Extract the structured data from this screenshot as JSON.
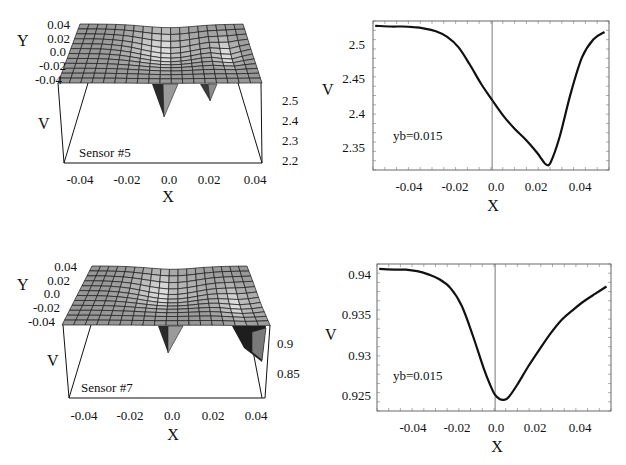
{
  "figure": {
    "panels": [
      {
        "id": "sensor5-surface",
        "kind": "surface3d",
        "label": "Sensor #5"
      },
      {
        "id": "sensor5-profile",
        "kind": "line",
        "annotation": "yb=0.015"
      },
      {
        "id": "sensor7-surface",
        "kind": "surface3d",
        "label": "Sensor #7"
      },
      {
        "id": "sensor7-profile",
        "kind": "line",
        "annotation": "yb=0.015"
      }
    ]
  },
  "chart_data": [
    {
      "type": "surface3d",
      "title": "",
      "annotation": "Sensor #5",
      "xlabel": "X",
      "ylabel": "Y",
      "zlabel": "V",
      "x_ticks": [
        "-0.04",
        "-0.02",
        "0.0",
        "0.02",
        "0.04"
      ],
      "y_ticks": [
        "0.04",
        "0.02",
        "0.0",
        "-0.02",
        "-0.04"
      ],
      "z_ticks": [
        "2.5",
        "2.4",
        "2.3",
        "2.2"
      ],
      "xlim": [
        -0.05,
        0.05
      ],
      "ylim": [
        -0.05,
        0.05
      ],
      "zlim": [
        2.15,
        2.55
      ],
      "features": [
        {
          "kind": "dip",
          "x": 0.0,
          "y": 0.0,
          "depth_to": 2.2
        },
        {
          "kind": "dip",
          "x": 0.02,
          "y": -0.02,
          "depth_to": 2.3
        }
      ]
    },
    {
      "type": "line",
      "title": "",
      "annotation": "yb=0.015",
      "xlabel": "X",
      "ylabel": "V",
      "x_ticks": [
        "-0.04",
        "-0.02",
        "0.0",
        "0.02",
        "0.04"
      ],
      "y_ticks": [
        "2.5",
        "2.45",
        "2.4",
        "2.35"
      ],
      "xlim": [
        -0.053,
        0.052
      ],
      "ylim": [
        2.318,
        2.535
      ],
      "grid": false,
      "vline_at": 0.0,
      "x": [
        -0.052,
        -0.045,
        -0.04,
        -0.035,
        -0.03,
        -0.025,
        -0.02,
        -0.015,
        -0.01,
        -0.005,
        0.0,
        0.005,
        0.01,
        0.015,
        0.02,
        0.022,
        0.024,
        0.026,
        0.03,
        0.035,
        0.04,
        0.045,
        0.05
      ],
      "values": [
        2.528,
        2.527,
        2.527,
        2.526,
        2.524,
        2.52,
        2.512,
        2.497,
        2.472,
        2.444,
        2.42,
        2.397,
        2.378,
        2.362,
        2.343,
        2.334,
        2.326,
        2.329,
        2.366,
        2.43,
        2.482,
        2.508,
        2.519
      ]
    },
    {
      "type": "surface3d",
      "title": "",
      "annotation": "Sensor #7",
      "xlabel": "X",
      "ylabel": "Y",
      "zlabel": "V",
      "x_ticks": [
        "-0.04",
        "-0.02",
        "0.0",
        "0.02",
        "0.04"
      ],
      "y_ticks": [
        "0.04",
        "0.02",
        "0.0",
        "-0.02",
        "-0.04"
      ],
      "z_ticks": [
        "0.9",
        "0.85"
      ],
      "xlim": [
        -0.05,
        0.05
      ],
      "ylim": [
        -0.05,
        0.05
      ],
      "zlim": [
        0.82,
        0.95
      ],
      "features": [
        {
          "kind": "dip",
          "x": 0.0,
          "y": -0.01,
          "depth_to": 0.88
        },
        {
          "kind": "dip",
          "x": 0.045,
          "y": -0.04,
          "depth_to": 0.87
        }
      ]
    },
    {
      "type": "line",
      "title": "",
      "annotation": "yb=0.015",
      "xlabel": "X",
      "ylabel": "V",
      "x_ticks": [
        "-0.04",
        "-0.02",
        "0.0",
        "0.02",
        "0.04"
      ],
      "y_ticks": [
        "0.94",
        "0.935",
        "0.93",
        "0.925"
      ],
      "xlim": [
        -0.053,
        0.052
      ],
      "ylim": [
        0.9231,
        0.9414
      ],
      "grid": false,
      "vline_at": 0.0,
      "x": [
        -0.052,
        -0.045,
        -0.04,
        -0.035,
        -0.03,
        -0.025,
        -0.02,
        -0.015,
        -0.01,
        -0.005,
        -0.002,
        0.0,
        0.002,
        0.004,
        0.006,
        0.01,
        0.015,
        0.02,
        0.025,
        0.03,
        0.035,
        0.04,
        0.045,
        0.05
      ],
      "values": [
        0.9408,
        0.9407,
        0.9407,
        0.9405,
        0.9401,
        0.9395,
        0.9384,
        0.9362,
        0.9325,
        0.9283,
        0.9262,
        0.9251,
        0.9246,
        0.9245,
        0.9248,
        0.9264,
        0.9287,
        0.9308,
        0.9328,
        0.9345,
        0.9357,
        0.9368,
        0.9377,
        0.9386
      ]
    }
  ]
}
